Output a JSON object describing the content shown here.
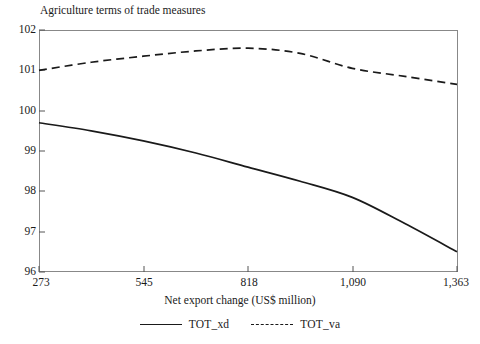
{
  "chart_data": {
    "type": "line",
    "title": "Agriculture terms of trade measures",
    "xlabel": "Net export change (US$ million)",
    "ylabel": "",
    "xlim": [
      273,
      1363
    ],
    "ylim": [
      96,
      102
    ],
    "xticks": [
      273,
      545,
      818,
      1090,
      1363
    ],
    "xtick_labels": [
      "273",
      "545",
      "818",
      "1,090",
      "1,363"
    ],
    "yticks": [
      96,
      97,
      98,
      99,
      100,
      101,
      102
    ],
    "ytick_labels": [
      "96",
      "97",
      "98",
      "99",
      "100",
      "101",
      "102"
    ],
    "grid": false,
    "legend_position": "bottom",
    "x": [
      273,
      409,
      545,
      682,
      818,
      954,
      1090,
      1227,
      1363
    ],
    "series": [
      {
        "name": "TOT_xd",
        "style": "solid",
        "color": "#1a1a1a",
        "values": [
          99.7,
          99.5,
          99.25,
          98.95,
          98.6,
          98.25,
          97.85,
          97.2,
          96.5
        ]
      },
      {
        "name": "TOT_va",
        "style": "dashed",
        "color": "#1a1a1a",
        "values": [
          101.0,
          101.2,
          101.35,
          101.48,
          101.55,
          101.42,
          101.05,
          100.85,
          100.65
        ]
      }
    ]
  },
  "legend": {
    "items": [
      {
        "label": "TOT_xd",
        "style": "solid"
      },
      {
        "label": "TOT_va",
        "style": "dashed"
      }
    ]
  }
}
